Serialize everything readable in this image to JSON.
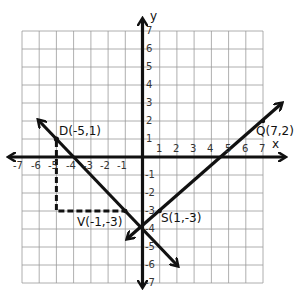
{
  "diagram": {
    "type": "coordinate-plane",
    "grid": {
      "x_min": -7,
      "x_max": 7,
      "y_min": -7,
      "y_max": 7
    },
    "axes": {
      "x_label": "x",
      "y_label": "y"
    },
    "x_ticks": [
      "-7",
      "-6",
      "-5",
      "-4",
      "-3",
      "-2",
      "-1",
      "1",
      "2",
      "3",
      "4",
      "5",
      "6",
      "7"
    ],
    "y_ticks": [
      "7",
      "6",
      "5",
      "4",
      "3",
      "2",
      "1",
      "-1",
      "-2",
      "-3",
      "-4",
      "-5",
      "-6",
      "-7"
    ],
    "points": [
      {
        "name": "D",
        "label": "D(-5,1)",
        "x": -5,
        "y": 1
      },
      {
        "name": "V",
        "label": "V(-1,-3)",
        "x": -1,
        "y": -3
      },
      {
        "name": "S",
        "label": "S(1,-3)",
        "x": 1,
        "y": -3
      },
      {
        "name": "Q",
        "label": "Q(7,2)",
        "x": 7,
        "y": 2
      }
    ],
    "lines": [
      {
        "name": "line-through-D",
        "from": [
          -6,
          2
        ],
        "to": [
          2,
          -6
        ],
        "arrows": "both"
      },
      {
        "name": "line-through-S-Q",
        "from": [
          -1,
          -4.8
        ],
        "to": [
          8,
          3
        ],
        "arrows": "both"
      }
    ],
    "dashed_segments": [
      {
        "from": [
          -5,
          1
        ],
        "to": [
          -5,
          -3
        ]
      },
      {
        "from": [
          -5,
          -3
        ],
        "to": [
          -1,
          -3
        ]
      }
    ],
    "colors": {
      "grid": "#9a9a9a",
      "axis": "#111111",
      "line": "#111111"
    }
  },
  "labels": {
    "x_axis": "x",
    "y_axis": "y",
    "D": "D(-5,1)",
    "V": "V(-1,-3)",
    "S": "S(1,-3)",
    "Q": "Q(7,2)",
    "x_ticks": {
      "n7": "-7",
      "n6": "-6",
      "n5": "-5",
      "n4": "-4",
      "n3": "-3",
      "n2": "-2",
      "n1": "-1",
      "p1": "1",
      "p2": "2",
      "p3": "3",
      "p4": "4",
      "p5": "5",
      "p6": "6",
      "p7": "7"
    },
    "y_ticks": {
      "p7": "7",
      "p6": "6",
      "p5": "5",
      "p4": "4",
      "p3": "3",
      "p2": "2",
      "p1": "1",
      "n1": "-1",
      "n2": "-2",
      "n3": "-3",
      "n4": "-4",
      "n5": "-5",
      "n6": "-6",
      "n7": "-7"
    }
  }
}
